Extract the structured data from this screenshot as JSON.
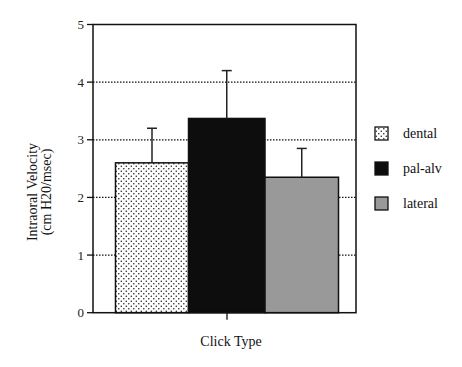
{
  "chart_data": {
    "type": "bar",
    "title": "",
    "xlabel": "Click Type",
    "ylabel": [
      "Intraoral Velocity",
      "(cm H20/msec)"
    ],
    "ylim": [
      0,
      5
    ],
    "yticks": [
      0,
      1,
      2,
      3,
      4,
      5
    ],
    "grid": true,
    "grid_style": "dotted horizontal",
    "legend_position": "right",
    "categories": [
      "dental",
      "pal-alv",
      "lateral"
    ],
    "series": [
      {
        "name": "dental",
        "value": 2.6,
        "error_upper": 3.2,
        "fill": "stipple",
        "color": "#ffffff"
      },
      {
        "name": "pal-alv",
        "value": 3.37,
        "error_upper": 4.2,
        "fill": "solid",
        "color": "#0d0d0d"
      },
      {
        "name": "lateral",
        "value": 2.35,
        "error_upper": 2.85,
        "fill": "solid",
        "color": "#999999"
      }
    ]
  },
  "legend": {
    "items": [
      {
        "label": "dental"
      },
      {
        "label": "pal-alv"
      },
      {
        "label": "lateral"
      }
    ]
  }
}
